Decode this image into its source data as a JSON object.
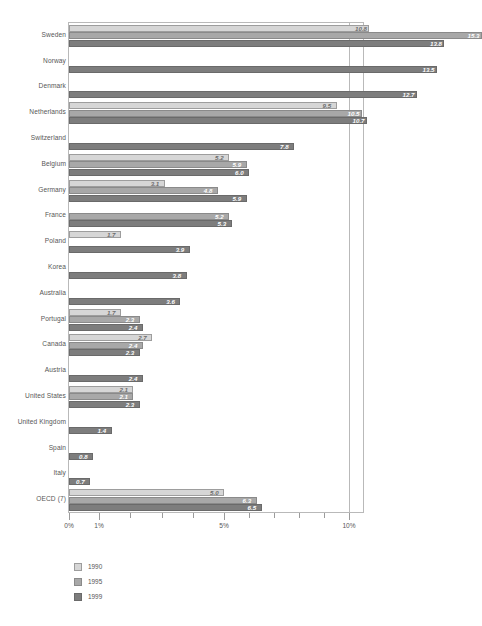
{
  "chart_data": {
    "type": "bar",
    "orientation": "horizontal",
    "title": "",
    "xlabel": "",
    "ylabel": "",
    "xscale": "log-like",
    "xlim": [
      0,
      10.6
    ],
    "grid": true,
    "legend_position": "bottom-left",
    "axis_tick_labels": [
      "0%",
      "1%",
      "5%",
      "10%"
    ],
    "axis_tick_values": [
      0,
      1,
      5,
      10
    ],
    "minor_tick_values": [
      2,
      3,
      4,
      6,
      7,
      8,
      9
    ],
    "categories": [
      "Sweden",
      "Norway",
      "Denmark",
      "Netherlands",
      "Switzerland",
      "Belgium",
      "Germany",
      "France",
      "Poland",
      "Korea",
      "Australia",
      "Portugal",
      "Canada",
      "Austria",
      "United States",
      "United Kingdom",
      "Spain",
      "Italy",
      "OECD (7)"
    ],
    "series": [
      {
        "name": "1990",
        "color": "#d6d6d6",
        "values": [
          10.8,
          null,
          null,
          9.5,
          null,
          5.2,
          3.1,
          null,
          1.7,
          null,
          null,
          1.7,
          2.7,
          null,
          2.1,
          null,
          null,
          null,
          5.0
        ]
      },
      {
        "name": "1995",
        "color": "#a8a8a8",
        "values": [
          15.3,
          null,
          null,
          10.5,
          null,
          5.9,
          4.8,
          5.2,
          null,
          null,
          null,
          2.3,
          2.4,
          null,
          2.1,
          null,
          null,
          null,
          6.3
        ]
      },
      {
        "name": "1999",
        "color": "#7d7d7d",
        "values": [
          13.8,
          13.5,
          12.7,
          10.7,
          7.8,
          6.0,
          5.9,
          5.3,
          3.9,
          3.8,
          3.6,
          2.4,
          2.3,
          2.4,
          2.3,
          1.4,
          0.8,
          0.7,
          6.5
        ]
      }
    ],
    "value_labels": {
      "Sweden": [
        "10.8",
        "15.3",
        "13.8"
      ],
      "Norway": [
        null,
        null,
        "13.5"
      ],
      "Denmark": [
        null,
        null,
        "12.7"
      ],
      "Netherlands": [
        "9.5",
        "10.5",
        "10.7"
      ],
      "Switzerland": [
        null,
        null,
        "7.8"
      ],
      "Belgium": [
        "5.2",
        "5.9",
        "6.0"
      ],
      "Germany": [
        "3.1",
        "4.8",
        "5.9"
      ],
      "France": [
        null,
        "5.2",
        "5.3"
      ],
      "Poland": [
        "1.7",
        null,
        "3.9"
      ],
      "Korea": [
        null,
        null,
        "3.8"
      ],
      "Australia": [
        null,
        null,
        "3.6"
      ],
      "Portugal": [
        "1.7",
        "2.3",
        "2.4"
      ],
      "Canada": [
        "2.7",
        "2.4",
        "2.3"
      ],
      "Austria": [
        null,
        null,
        "2.4"
      ],
      "United States": [
        "2.1",
        "2.1",
        "2.3"
      ],
      "United Kingdom": [
        null,
        null,
        "1.4"
      ],
      "Spain": [
        null,
        null,
        "0.8"
      ],
      "Italy": [
        null,
        null,
        "0.7"
      ],
      "OECD (7)": [
        "5.0",
        "6.3",
        "6.5"
      ]
    }
  },
  "legend": {
    "items": [
      {
        "label": "1990",
        "key": "y1990"
      },
      {
        "label": "1995",
        "key": "y1995"
      },
      {
        "label": "1999",
        "key": "y1999"
      }
    ]
  }
}
